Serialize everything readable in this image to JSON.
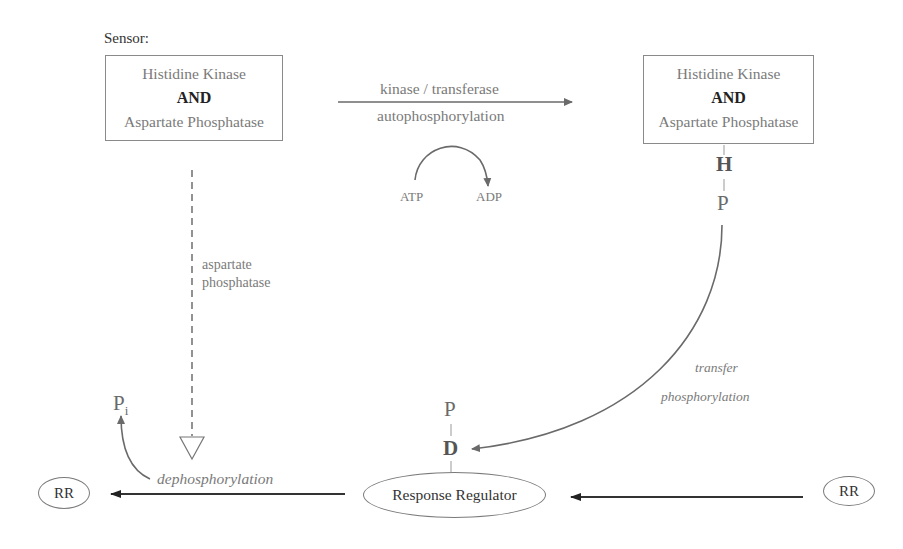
{
  "sensor_label": "Sensor:",
  "left_box": {
    "line1": "Histidine Kinase",
    "line2": "AND",
    "line3": "Aspartate  Phosphatase"
  },
  "right_box": {
    "line1": "Histidine Kinase",
    "line2": "AND",
    "line3": "Aspartate  Phosphatase"
  },
  "top_arrow": {
    "label_above": "kinase / transferase",
    "label_below": "autophosphorylation"
  },
  "atp_adp": {
    "atp": "ATP",
    "adp": "ADP"
  },
  "right_chain": {
    "h": "H",
    "p": "P"
  },
  "dashed_arrow_label": {
    "line1": "aspartate",
    "line2": "phosphatase"
  },
  "transfer_label": {
    "line1": "transfer",
    "line2": "phosphorylation"
  },
  "rr_chain": {
    "p": "P",
    "d": "D"
  },
  "pi": {
    "p": "P",
    "sub": "i"
  },
  "dephos_label": "dephosphorylation",
  "response_regulator": "Response Regulator",
  "rr_left": "RR",
  "rr_right": "RR",
  "colors": {
    "line": "#777777",
    "dark_arrow": "#333333",
    "text_gray": "#7a7a7a"
  }
}
